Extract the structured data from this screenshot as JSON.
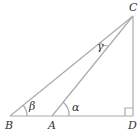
{
  "diagram": {
    "points": {
      "A": "A",
      "B": "B",
      "C": "C",
      "D": "D"
    },
    "angles": {
      "alpha": "α",
      "beta": "β",
      "gamma": "γ"
    },
    "line_color": "#aaaaaa",
    "text_color": "#333333"
  }
}
